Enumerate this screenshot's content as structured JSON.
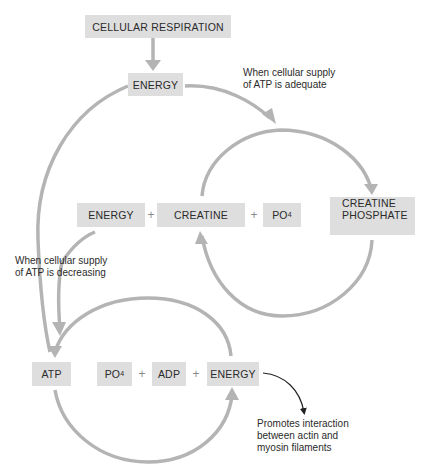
{
  "diagram": {
    "title_box": "CELLULAR RESPIRATION",
    "energy_top": "ENERGY",
    "note_adequate": {
      "line1": "When cellular supply",
      "line2": "of ATP is adequate"
    },
    "note_decreasing": {
      "line1": "When cellular supply",
      "line2": "of ATP is decreasing"
    },
    "upper_cycle": {
      "energy": "ENERGY",
      "plus1": "+",
      "creatine": "CREATINE",
      "plus2": "+",
      "po4_base": "PO",
      "po4_sub": "4",
      "product_line1": "CREATINE",
      "product_line2": "PHOSPHATE"
    },
    "lower_cycle": {
      "atp": "ATP",
      "po4_base": "PO",
      "po4_sub": "4",
      "plus1": "+",
      "adp": "ADP",
      "plus2": "+",
      "energy": "ENERGY"
    },
    "note_promotes": {
      "line1": "Promotes interaction",
      "line2": "between actin and",
      "line3": "myosin filaments"
    },
    "colors": {
      "box_fill": "#dedede",
      "arrow_gray": "#b4b4b4",
      "arrow_black": "#222222",
      "text": "#2b2b2b"
    }
  }
}
